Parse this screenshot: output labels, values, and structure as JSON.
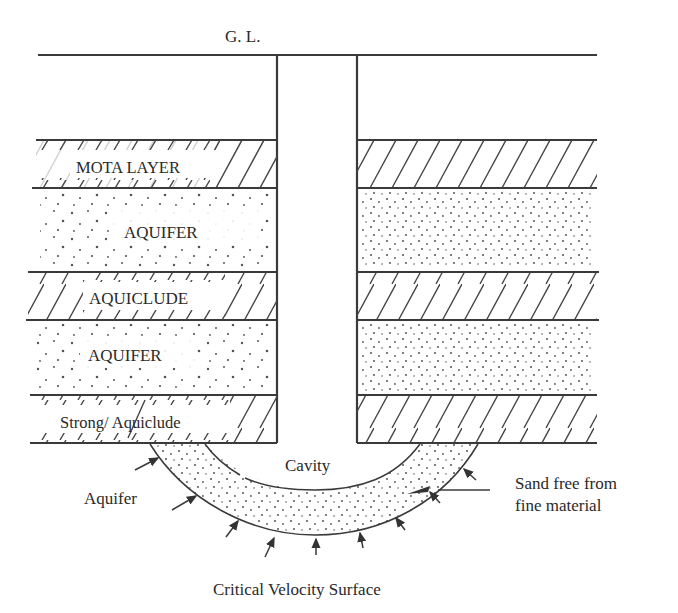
{
  "labels": {
    "ground_level": "G. L.",
    "mota_layer": "MOTA LAYER",
    "aquifer_upper": "AQUIFER",
    "aquiclude": "AQUICLUDE",
    "aquifer_lower": "AQUIFER",
    "strong_aquiclude": "Strong/ Aquiclude",
    "cavity": "Cavity",
    "aquifer_bottom": "Aquifer",
    "sand_line1": "Sand free from",
    "sand_line2": "fine material",
    "critical_velocity": "Critical Velocity Surface"
  },
  "layers": [
    {
      "name": "Mota Layer",
      "type": "hatched",
      "top": 140,
      "bottom": 188
    },
    {
      "name": "Aquifer",
      "type": "dotted",
      "top": 188,
      "bottom": 272
    },
    {
      "name": "Aquiclude",
      "type": "hatched",
      "top": 272,
      "bottom": 320
    },
    {
      "name": "Aquifer",
      "type": "dotted",
      "top": 320,
      "bottom": 395
    },
    {
      "name": "Strong Aquiclude",
      "type": "hatched",
      "top": 395,
      "bottom": 443
    }
  ],
  "well": {
    "left": 277,
    "right": 357,
    "ground_level_y": 55
  },
  "colors": {
    "line": "#3a3a3a",
    "text": "#2a2a2a",
    "background": "#ffffff"
  }
}
